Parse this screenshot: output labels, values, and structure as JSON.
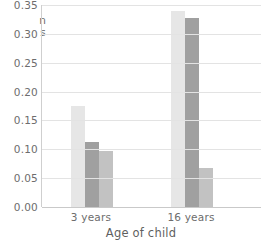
{
  "chart_data": {
    "type": "bar",
    "title": "",
    "xlabel": "Age of child",
    "ylabel": "Proportion of children",
    "categories": [
      "3 years",
      "16 years"
    ],
    "series": [
      {
        "name": "series-1",
        "color": "#e6e6e6",
        "values": [
          0.175,
          0.34
        ]
      },
      {
        "name": "series-2",
        "color": "#a0a0a0",
        "values": [
          0.112,
          0.328
        ]
      },
      {
        "name": "series-3",
        "color": "#c2c2c2",
        "values": [
          0.097,
          0.068
        ]
      }
    ],
    "ylim": [
      0.0,
      0.35
    ],
    "yticks": [
      "0.00",
      "0.05",
      "0.10",
      "0.15",
      "0.20",
      "0.25",
      "0.30",
      "0.35"
    ],
    "ytick_values": [
      0.0,
      0.05,
      0.1,
      0.15,
      0.2,
      0.25,
      0.3,
      0.35
    ],
    "grid": "horizontal",
    "legend": "none"
  },
  "axes": {
    "y_title_clipped_text": "n\ns",
    "y_tick_top_clipped": "0.35",
    "x_title": "Age of child"
  },
  "colors": {
    "gridline": "#e3e3e3",
    "axis_line": "#cfcfcf",
    "baseline": "#c9c9c9",
    "text": "#6d6d6d",
    "background": "#ffffff"
  }
}
